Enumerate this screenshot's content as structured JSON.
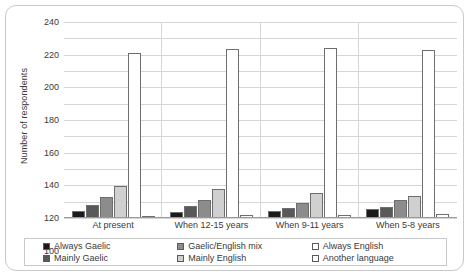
{
  "chart_data": {
    "type": "bar",
    "title": "",
    "xlabel": "",
    "ylabel": "Number of respondents",
    "ylim": [
      0,
      240
    ],
    "ytick_step": 20,
    "yticks": [
      240,
      220,
      200,
      180,
      160,
      140,
      120,
      100,
      80,
      60,
      40,
      20,
      0
    ],
    "grid": true,
    "legend_position": "bottom",
    "categories": [
      "At present",
      "When 12-15 years",
      "When 9-11 years",
      "When 5-8 years"
    ],
    "series": [
      {
        "name": "Always Gaelic",
        "color": "#1a1a1a",
        "values": [
          8,
          7,
          8,
          11
        ]
      },
      {
        "name": "Mainly Gaelic",
        "color": "#595959",
        "values": [
          16,
          15,
          12,
          13
        ]
      },
      {
        "name": "Gaelic/English mix",
        "color": "#8c8c8c",
        "values": [
          26,
          22,
          18,
          22
        ]
      },
      {
        "name": "Mainly English",
        "color": "#d0d0d0",
        "values": [
          39,
          35,
          31,
          27
        ]
      },
      {
        "name": "Always English",
        "color": "#ffffff",
        "values": [
          202,
          207,
          208,
          206
        ]
      },
      {
        "name": "Another language",
        "color": "#ffffff",
        "values": [
          3,
          4,
          4,
          5
        ]
      }
    ]
  },
  "legend": {
    "items": [
      "Always Gaelic",
      "Mainly Gaelic",
      "Gaelic/English mix",
      "Mainly English",
      "Always English",
      "Another language"
    ]
  }
}
